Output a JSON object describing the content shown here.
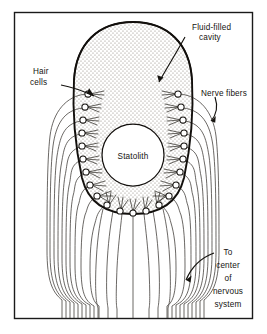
{
  "figure": {
    "type": "biological-schematic",
    "border_color": "#1a1a1a",
    "ink_color": "#15130f",
    "stipple_color": "#9a9288",
    "background": "#ffffff"
  },
  "labels": {
    "fluid_filled_cavity": {
      "line1": "Fluid-filled",
      "line2": "cavity"
    },
    "hair_cells": {
      "line1": "Hair",
      "line2": "cells"
    },
    "nerve_fibers": {
      "line1": "Nerve fibers"
    },
    "statolith": {
      "line1": "Statolith"
    },
    "to_center": {
      "line1": "To",
      "line2": "center",
      "line3": "of",
      "line4": "nervous",
      "line5": "system"
    }
  },
  "structures": {
    "cavity": {
      "name": "fluid-filled cavity",
      "fill": "stippled"
    },
    "statolith": {
      "name": "statolith",
      "cx": 133,
      "cy": 155,
      "r": 31
    },
    "hair_cell_count_left": 9,
    "hair_cell_count_right": 9,
    "hair_cell_count_bottom": 5,
    "nerve_bundle_lines": 24
  }
}
